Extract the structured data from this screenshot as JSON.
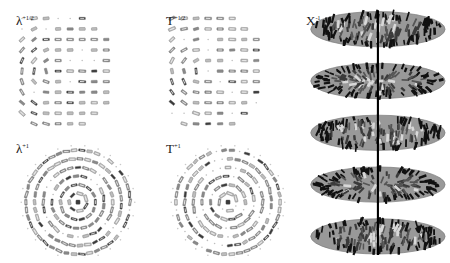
{
  "figure": {
    "background_color": "#ffffff",
    "width": 450,
    "height": 263,
    "panel_count": 5
  },
  "panels": [
    {
      "id": "lambda-half",
      "label_base": "λ",
      "label_sup": "+1/2",
      "label_full": "λ+1/2",
      "position": {
        "x": 8,
        "y": 6,
        "width": 140,
        "height": 124
      },
      "label_position": {
        "x": 16,
        "y": 14
      },
      "pattern": "rod-mosaic-left-arc-right-grid",
      "region_shape": "rounded-square-with-left-arc",
      "element_shape": "rod",
      "element_color_dark": "#3a3a3a",
      "element_color_mid": "#8a8a8a",
      "element_color_light": "#bdbdbd",
      "rows": 11,
      "cols": 11,
      "description": "Left half shows arc-following tilted rods, right half shows a regular grid of horizontal bars"
    },
    {
      "id": "t-half",
      "label_base": "T",
      "label_sup": "+1/2",
      "label_full": "T+1/2",
      "position": {
        "x": 158,
        "y": 6,
        "width": 140,
        "height": 124
      },
      "label_position": {
        "x": 166,
        "y": 14
      },
      "pattern": "rod-mosaic-left-arc-right-grid",
      "region_shape": "rounded-square-with-left-arc",
      "element_shape": "rod",
      "element_color_dark": "#3a3a3a",
      "element_color_mid": "#8a8a8a",
      "element_color_light": "#bdbdbd",
      "rows": 11,
      "cols": 11,
      "description": "Left half shows arc-following tilted rods, right half shows a regular grid of horizontal bars"
    },
    {
      "id": "lambda-one",
      "label_base": "λ",
      "label_sup": "+1",
      "label_full": "λ+1",
      "position": {
        "x": 8,
        "y": 134,
        "width": 140,
        "height": 124
      },
      "label_position": {
        "x": 16,
        "y": 142
      },
      "pattern": "radial-rod-disc",
      "region_shape": "circle",
      "element_shape": "rod",
      "element_color_dark": "#3a3a3a",
      "element_color_mid": "#8a8a8a",
      "element_color_light": "#bdbdbd",
      "rings": 6,
      "description": "Full circular field of radially oriented rods around a central point"
    },
    {
      "id": "t-one",
      "label_base": "T",
      "label_sup": "+1",
      "label_full": "T+1",
      "position": {
        "x": 158,
        "y": 134,
        "width": 140,
        "height": 124
      },
      "label_position": {
        "x": 166,
        "y": 142
      },
      "pattern": "radial-rod-disc",
      "region_shape": "circle",
      "element_shape": "rod",
      "element_color_dark": "#3a3a3a",
      "element_color_mid": "#8a8a8a",
      "element_color_light": "#bdbdbd",
      "rings": 6,
      "description": "Full circular field of radially oriented rods around a central point"
    },
    {
      "id": "x-inverse",
      "label_base": "X",
      "label_sup": "-1",
      "label_full": "X-1",
      "position": {
        "x": 302,
        "y": 2,
        "width": 146,
        "height": 259
      },
      "label_position": {
        "x": 306,
        "y": 14
      },
      "pattern": "stacked-elliptical-discs",
      "disc_count": 5,
      "disc_fill": "#999999",
      "disc_edge": "#7d7d7d",
      "rod_dark": "#111111",
      "rod_mid": "#555555",
      "rod_light": "#d8d8d8",
      "axis_color": "#000000",
      "axis_label": "vertical-axis",
      "description": "Five gray elliptical discs stacked vertically along a single black axis line, each disc textured with short dark rods"
    }
  ],
  "colors": {
    "background": "#ffffff",
    "text": "#1a1a1a",
    "disc_gray": "#999999",
    "rod_dark": "#111111",
    "rod_light": "#d8d8d8",
    "axis": "#000000"
  }
}
